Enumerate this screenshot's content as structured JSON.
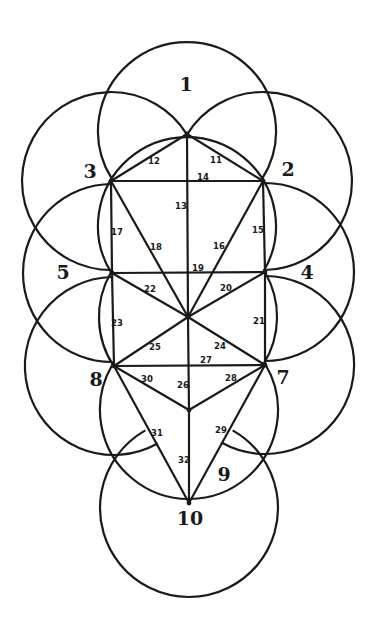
{
  "diagram": {
    "radius": 89,
    "colors": {
      "stroke": "#1a1a1a",
      "background": "#ffffff"
    },
    "points": {
      "P1": [
        187,
        134
      ],
      "P2": [
        263,
        181
      ],
      "P3": [
        111,
        181
      ],
      "D": [
        187,
        225
      ],
      "P4": [
        265,
        272
      ],
      "P5": [
        112,
        273
      ],
      "C": [
        188,
        317
      ],
      "P7": [
        265,
        365
      ],
      "P8": [
        114,
        366
      ],
      "V": [
        189,
        410
      ],
      "P10": [
        189,
        503
      ]
    },
    "arcs": [
      {
        "name": "circle-1",
        "center": [
          187,
          131
        ],
        "from": 148,
        "to": 392
      },
      {
        "name": "circle-2",
        "center": [
          263,
          181
        ],
        "from": 212,
        "to": 449
      },
      {
        "name": "circle-3",
        "center": [
          111,
          181
        ],
        "from": 90,
        "to": 328
      },
      {
        "name": "circle-daath",
        "center": [
          187,
          226
        ],
        "from": 148,
        "to": 391
      },
      {
        "name": "circle-4",
        "center": [
          265,
          272
        ],
        "from": 270,
        "to": 450
      },
      {
        "name": "circle-5",
        "center": [
          112,
          273
        ],
        "from": 90,
        "to": 270
      },
      {
        "name": "circle-6-left",
        "center": [
          188,
          317
        ],
        "from": 146,
        "to": 210
      },
      {
        "name": "circle-6-right",
        "center": [
          188,
          317
        ],
        "from": -30,
        "to": 32
      },
      {
        "name": "circle-7",
        "center": [
          265,
          365
        ],
        "from": -90,
        "to": 119
      },
      {
        "name": "circle-8",
        "center": [
          114,
          366
        ],
        "from": 61,
        "to": 269
      },
      {
        "name": "circle-9",
        "center": [
          189,
          410
        ],
        "from": -31,
        "to": 210
      },
      {
        "name": "circle-10",
        "center": [
          189,
          508
        ],
        "from": -60,
        "to": 240
      }
    ],
    "paths": [
      {
        "id": "11",
        "from": "P1",
        "to": "P2"
      },
      {
        "id": "12",
        "from": "P1",
        "to": "P3"
      },
      {
        "id": "13",
        "from": "P1",
        "to": "C"
      },
      {
        "id": "14",
        "from": "P3",
        "to": "P2"
      },
      {
        "id": "15",
        "from": "P2",
        "to": "P4"
      },
      {
        "id": "16",
        "from": "P2",
        "to": "C"
      },
      {
        "id": "17",
        "from": "P3",
        "to": "P5"
      },
      {
        "id": "18",
        "from": "P3",
        "to": "C"
      },
      {
        "id": "19",
        "from": "P5",
        "to": "P4"
      },
      {
        "id": "20",
        "from": "P4",
        "to": "C"
      },
      {
        "id": "21",
        "from": "P4",
        "to": "P7"
      },
      {
        "id": "22",
        "from": "P5",
        "to": "C"
      },
      {
        "id": "23",
        "from": "P5",
        "to": "P8"
      },
      {
        "id": "24",
        "from": "C",
        "to": "P7"
      },
      {
        "id": "25",
        "from": "C",
        "to": "P8"
      },
      {
        "id": "26",
        "from": "C",
        "to": "V"
      },
      {
        "id": "27",
        "from": "P8",
        "to": "P7"
      },
      {
        "id": "28",
        "from": "P7",
        "to": "V"
      },
      {
        "id": "29",
        "from": "P7",
        "to": "P10"
      },
      {
        "id": "30",
        "from": "P8",
        "to": "V"
      },
      {
        "id": "31",
        "from": "P8",
        "to": "P10"
      },
      {
        "id": "32",
        "from": "V",
        "to": "P10"
      }
    ],
    "node_labels": [
      {
        "text": "1",
        "x": 186,
        "y": 84
      },
      {
        "text": "2",
        "x": 288,
        "y": 169
      },
      {
        "text": "3",
        "x": 90,
        "y": 171
      },
      {
        "text": "4",
        "x": 307,
        "y": 272
      },
      {
        "text": "5",
        "x": 63,
        "y": 272
      },
      {
        "text": "7",
        "x": 283,
        "y": 377
      },
      {
        "text": "8",
        "x": 96,
        "y": 379
      },
      {
        "text": "9",
        "x": 224,
        "y": 474
      },
      {
        "text": "10",
        "x": 190,
        "y": 518
      }
    ],
    "path_labels": [
      {
        "text": "11",
        "x": 216,
        "y": 160
      },
      {
        "text": "12",
        "x": 154,
        "y": 161
      },
      {
        "text": "13",
        "x": 181,
        "y": 206
      },
      {
        "text": "14",
        "x": 203,
        "y": 177
      },
      {
        "text": "15",
        "x": 258,
        "y": 230
      },
      {
        "text": "16",
        "x": 219,
        "y": 246
      },
      {
        "text": "17",
        "x": 117,
        "y": 232
      },
      {
        "text": "18",
        "x": 156,
        "y": 247
      },
      {
        "text": "19",
        "x": 198,
        "y": 268
      },
      {
        "text": "20",
        "x": 226,
        "y": 288
      },
      {
        "text": "21",
        "x": 259,
        "y": 321
      },
      {
        "text": "22",
        "x": 150,
        "y": 289
      },
      {
        "text": "23",
        "x": 117,
        "y": 323
      },
      {
        "text": "24",
        "x": 220,
        "y": 346
      },
      {
        "text": "25",
        "x": 155,
        "y": 347
      },
      {
        "text": "26",
        "x": 183,
        "y": 385
      },
      {
        "text": "27",
        "x": 206,
        "y": 360
      },
      {
        "text": "28",
        "x": 231,
        "y": 378
      },
      {
        "text": "29",
        "x": 221,
        "y": 430
      },
      {
        "text": "30",
        "x": 147,
        "y": 379
      },
      {
        "text": "31",
        "x": 157,
        "y": 433
      },
      {
        "text": "32",
        "x": 184,
        "y": 460
      }
    ]
  }
}
